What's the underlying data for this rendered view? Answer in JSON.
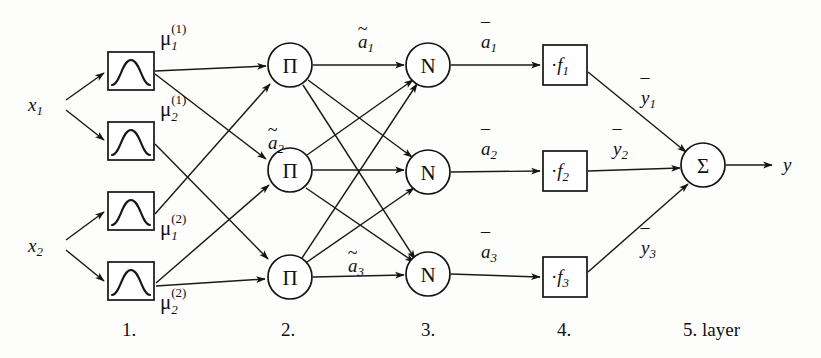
{
  "diagram": {
    "background_color": "#fdfdfc",
    "line_color": "#1a1a1a",
    "inputs": [
      {
        "id": "x1",
        "label": "x",
        "subscript": "1"
      },
      {
        "id": "x2",
        "label": "x",
        "subscript": "2"
      }
    ],
    "output": {
      "id": "y",
      "label": "y"
    },
    "layer1": {
      "name": "membership-function-layer",
      "glyph": "bell-curve",
      "nodes": [
        {
          "id": "mf11",
          "base": "μ",
          "sub": "1",
          "sup": "(1)",
          "label": "μ1(1)"
        },
        {
          "id": "mf21",
          "base": "μ",
          "sub": "2",
          "sup": "(1)",
          "label": "μ2(1)"
        },
        {
          "id": "mf12",
          "base": "μ",
          "sub": "1",
          "sup": "(2)",
          "label": "μ1(2)"
        },
        {
          "id": "mf22",
          "base": "μ",
          "sub": "2",
          "sup": "(2)",
          "label": "μ2(2)"
        }
      ]
    },
    "layer2": {
      "name": "product-layer",
      "glyph": "Π",
      "nodes": [
        {
          "id": "pi1",
          "glyph": "Π"
        },
        {
          "id": "pi2",
          "glyph": "Π"
        },
        {
          "id": "pi3",
          "glyph": "Π"
        }
      ],
      "edge_labels": [
        {
          "id": "atilde1",
          "base": "a",
          "sub": "1",
          "accent": "~",
          "label": "ã1"
        },
        {
          "id": "atilde2",
          "base": "a",
          "sub": "2",
          "accent": "~",
          "label": "ã2"
        },
        {
          "id": "atilde3",
          "base": "a",
          "sub": "3",
          "accent": "~",
          "label": "ã3"
        }
      ]
    },
    "layer3": {
      "name": "normalization-layer",
      "glyph": "N",
      "nodes": [
        {
          "id": "n1",
          "glyph": "N"
        },
        {
          "id": "n2",
          "glyph": "N"
        },
        {
          "id": "n3",
          "glyph": "N"
        }
      ],
      "edge_labels": [
        {
          "id": "abar1",
          "base": "a",
          "sub": "1",
          "accent": "¯",
          "label": "ā1"
        },
        {
          "id": "abar2",
          "base": "a",
          "sub": "2",
          "accent": "¯",
          "label": "ā2"
        },
        {
          "id": "abar3",
          "base": "a",
          "sub": "3",
          "accent": "¯",
          "label": "ā3"
        }
      ]
    },
    "layer4": {
      "name": "consequent-function-layer",
      "nodes": [
        {
          "id": "f1",
          "dot": "·",
          "base": "f",
          "sub": "1",
          "label": "·f1"
        },
        {
          "id": "f2",
          "dot": "·",
          "base": "f",
          "sub": "2",
          "label": "·f2"
        },
        {
          "id": "f3",
          "dot": "·",
          "base": "f",
          "sub": "3",
          "label": "·f3"
        }
      ],
      "edge_labels": [
        {
          "id": "ybar1",
          "base": "y",
          "sub": "1",
          "accent": "¯",
          "label": "ȳ₁"
        },
        {
          "id": "ybar2",
          "base": "y",
          "sub": "2",
          "accent": "¯",
          "label": "ȳ₂"
        },
        {
          "id": "ybar3",
          "base": "y",
          "sub": "3",
          "accent": "¯",
          "label": "ȳ₃"
        }
      ]
    },
    "layer5": {
      "name": "summation-layer",
      "nodes": [
        {
          "id": "sigma",
          "glyph": "Σ"
        }
      ]
    },
    "layer_captions": [
      {
        "id": "caption-1",
        "text": "1."
      },
      {
        "id": "caption-2",
        "text": "2."
      },
      {
        "id": "caption-3",
        "text": "3."
      },
      {
        "id": "caption-4",
        "text": "4."
      },
      {
        "id": "caption-5",
        "text": "5. layer"
      }
    ]
  }
}
